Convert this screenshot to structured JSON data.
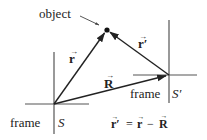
{
  "diagram": {
    "type": "vector-reference-frames",
    "labels": {
      "object": "object",
      "vector_r": "r",
      "vector_r_prime": "r′",
      "vector_R": "R",
      "frame_S_word": "frame",
      "frame_S_symbol": "S",
      "frame_S_prime_word": "frame",
      "frame_S_prime_symbol": "S′",
      "equation": {
        "lhs": "r′",
        "eq": "=",
        "term1": "r",
        "minus": "−",
        "term2": "R"
      }
    },
    "points": {
      "origin_S": [
        54,
        104
      ],
      "origin_S_prime": [
        169,
        75
      ],
      "object": [
        107,
        30
      ]
    },
    "vectors": [
      {
        "name": "r",
        "from": "origin_S",
        "to": "object"
      },
      {
        "name": "R",
        "from": "origin_S",
        "to": "origin_S_prime"
      },
      {
        "name": "r′",
        "from": "origin_S_prime",
        "to": "object"
      }
    ],
    "colors": {
      "axis": "#555555",
      "vector": "#222222",
      "text": "#222222",
      "background": "#ffffff"
    }
  }
}
